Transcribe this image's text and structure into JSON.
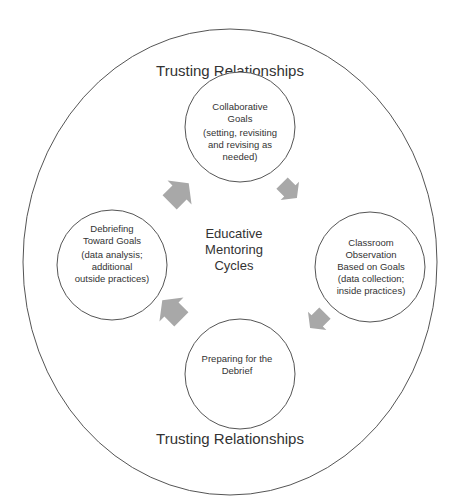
{
  "outer": {
    "top_label": "Trusting Relationships",
    "bottom_label": "Trusting Relationships"
  },
  "center": {
    "lines": [
      "Educative",
      "Mentoring",
      "Cycles"
    ]
  },
  "nodes": [
    {
      "id": "top",
      "lines": [
        "Collaborative",
        "Goals",
        "(setting, revisiting",
        "and revising as",
        "needed)"
      ]
    },
    {
      "id": "right",
      "lines": [
        "Classroom",
        "Observation",
        "Based on Goals",
        "(data collection;",
        "inside practices)"
      ]
    },
    {
      "id": "bottom",
      "lines": [
        "Preparing for the",
        "Debrief"
      ]
    },
    {
      "id": "left",
      "lines": [
        "Debriefing",
        "Toward Goals",
        "(data analysis;",
        "additional",
        "outside practices)"
      ]
    }
  ],
  "colors": {
    "stroke": "#555555",
    "arrow": "#a8a8a8",
    "text": "#333333"
  }
}
